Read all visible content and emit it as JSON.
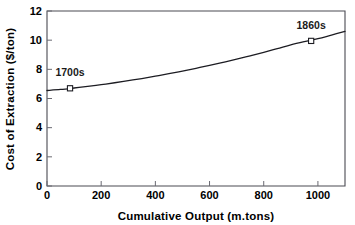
{
  "chart_data": {
    "type": "line",
    "title": "",
    "xlabel": "Cumulative Output (m.tons)",
    "ylabel": "Cost of Extraction ($/ton)",
    "xlim": [
      0,
      1100
    ],
    "ylim": [
      0,
      12
    ],
    "grid": false,
    "legend": "none",
    "x_ticks": [
      0,
      200,
      400,
      600,
      800,
      1000
    ],
    "x_tick_labels": [
      "0",
      "200",
      "400",
      "600",
      "800",
      "1000"
    ],
    "y_ticks": [
      0,
      2,
      4,
      6,
      8,
      10,
      12
    ],
    "y_tick_labels": [
      "0",
      "2",
      "4",
      "6",
      "8",
      "10",
      "12"
    ],
    "series": [
      {
        "name": "Cost of Extraction",
        "x": [
          0,
          50,
          100,
          150,
          200,
          250,
          300,
          350,
          400,
          450,
          500,
          550,
          600,
          650,
          700,
          750,
          800,
          850,
          900,
          950,
          1000,
          1050,
          1100
        ],
        "values": [
          6.55,
          6.62,
          6.72,
          6.83,
          6.95,
          7.08,
          7.22,
          7.37,
          7.53,
          7.7,
          7.88,
          8.07,
          8.27,
          8.48,
          8.7,
          8.93,
          9.17,
          9.42,
          9.68,
          9.9,
          10.1,
          10.35,
          10.6
        ]
      }
    ],
    "markers": [
      {
        "label": "1700s",
        "x": 85,
        "y": 6.7
      },
      {
        "label": "1860s",
        "x": 975,
        "y": 9.95
      }
    ],
    "colors": {
      "curve": "#1c1c22",
      "frame": "#4a4a52",
      "text": "#000000",
      "background": "#ffffff",
      "marker_fill": "#ffffff"
    }
  },
  "axes": {
    "x_title": "Cumulative Output (m.tons)",
    "y_title": "Cost of Extraction ($/ton)"
  }
}
